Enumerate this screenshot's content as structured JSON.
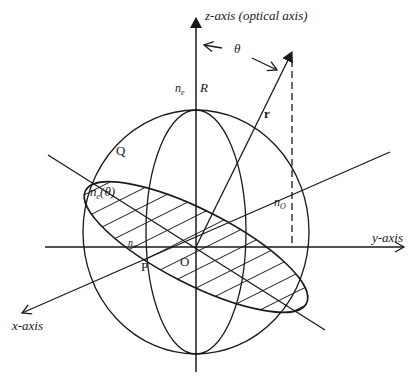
{
  "diagram": {
    "type": "index-ellipsoid",
    "labels": {
      "z_axis": "z-axis (optical axis)",
      "y_axis": "y-axis",
      "x_axis": "x-axis",
      "theta": "θ",
      "r": "r",
      "n_e": "n",
      "n_e_sub": "e",
      "R": "R",
      "Q": "Q",
      "n_e_theta": "n",
      "n_e_theta_sub": "e",
      "n_e_theta_arg": "(θ)",
      "n_o_right": "n",
      "n_o_right_sub": "O",
      "n_o_left": "n",
      "n_o_left_sub": "o",
      "O": "O",
      "P": "P"
    },
    "colors": {
      "stroke": "#1a1a1a",
      "background": "#ffffff"
    }
  }
}
